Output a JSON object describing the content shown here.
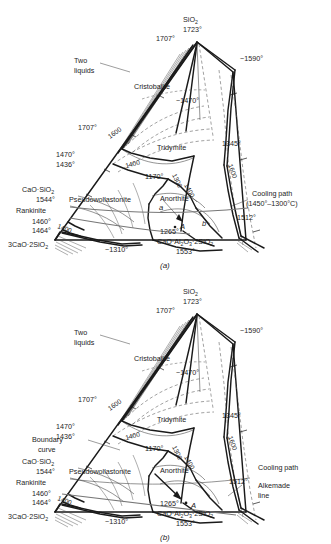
{
  "figure": {
    "type": "ternary-phase-diagram",
    "system": "CaO-Al2O3-SiO2",
    "panels": [
      {
        "caption": "(a)",
        "vertices": {
          "apex": {
            "formula": "SiO2",
            "temp": "1723°"
          },
          "left_side_top": "1707°",
          "right_note": "~1590°"
        },
        "labels": [
          {
            "name": "two-liquids",
            "text": "Two\nliquids",
            "line1": "Two",
            "line2": "liquids"
          },
          {
            "name": "cristobalite",
            "text": "Cristobalite"
          },
          {
            "name": "tridymite",
            "text": "Tridymite"
          },
          {
            "name": "pseudowollastonite",
            "text": "Pseudowollastonite"
          },
          {
            "name": "anorthite",
            "text": "Anorthite"
          },
          {
            "name": "rankinite",
            "text": "Rankinite"
          },
          {
            "name": "cooling-path",
            "line1": "Cooling path",
            "line2": "(1450°–1300°C)"
          }
        ],
        "temperatures": [
          "1723°",
          "1707°",
          "~1590°",
          "~1470°",
          "1707°",
          "1470°",
          "1436°",
          "1170°",
          "1345°",
          "1512°",
          "1544°",
          "1460°",
          "1464°",
          "1265°",
          "~1310°",
          "1553°"
        ],
        "isotherms": [
          "1600",
          "1600",
          "1400",
          "1400",
          "1300",
          "1400",
          "1600"
        ],
        "compounds": [
          {
            "name": "cao-sio2",
            "text": "CaO·SiO2",
            "temp": "1544°"
          },
          {
            "name": "3cao-2sio2",
            "text": "3CaO·2SiO2"
          },
          {
            "name": "cao-al2o3-2sio2",
            "text": "CaO·Al2O3·2SiO2",
            "temp": "1553°"
          }
        ],
        "point_markers": [
          "a",
          "A",
          "b"
        ]
      },
      {
        "caption": "(b)",
        "vertices": {
          "apex": {
            "formula": "SiO2",
            "temp": "1723°"
          },
          "left_side_top": "1707°",
          "right_note": "~1590°"
        },
        "labels": [
          {
            "name": "two-liquids",
            "line1": "Two",
            "line2": "liquids"
          },
          {
            "name": "cristobalite",
            "text": "Cristobalite"
          },
          {
            "name": "tridymite",
            "text": "Tridymite"
          },
          {
            "name": "boundary-curve",
            "line1": "Boundary",
            "line2": "curve"
          },
          {
            "name": "pseudowollastonite",
            "text": "Pseudowollastonite"
          },
          {
            "name": "anorthite",
            "text": "Anorthite"
          },
          {
            "name": "rankinite",
            "text": "Rankinite"
          },
          {
            "name": "cooling-path",
            "text": "Cooling path"
          },
          {
            "name": "alkemade-line",
            "line1": "Alkemade",
            "line2": "line"
          }
        ],
        "temperatures": [
          "1723°",
          "1707°",
          "~1590°",
          "~1470°",
          "1707°",
          "1470°",
          "1436°",
          "1170°",
          "1345°",
          "1512°",
          "1544°",
          "1460°",
          "1464°",
          "1265°",
          "~1310°",
          "1553°"
        ],
        "isotherms": [
          "1600",
          "1600",
          "1400",
          "1400",
          "1300",
          "1400",
          "1600"
        ],
        "compounds": [
          {
            "name": "cao-sio2",
            "text": "CaO·SiO2",
            "temp": "1544°"
          },
          {
            "name": "3cao-2sio2",
            "text": "3CaO·2SiO2"
          },
          {
            "name": "cao-al2o3-2sio2",
            "text": "CaO·Al2O3·2SiO2",
            "temp": "1553°"
          }
        ],
        "point_markers": [
          "A"
        ]
      }
    ]
  },
  "a": {
    "apex_formula": "SiO",
    "apex_sub": "2",
    "apex_temp": "1723°",
    "t_1707_apex": "1707°",
    "t_1590": "~1590°",
    "two_liquids_1": "Two",
    "two_liquids_2": "liquids",
    "cristobalite": "Cristobalite",
    "t_1470_in": "~1470°",
    "t_1707_left": "1707°",
    "iso_1600_left": "1600",
    "t_1470_l": "1470°",
    "t_1436_l": "1436°",
    "tridymite": "Tridymite",
    "iso_1400_mid": "1400",
    "t_1170": "1170°",
    "iso_1300": "1300",
    "iso_1400_r": "1400",
    "t_1345": "1345°",
    "iso_1600_r": "1600",
    "caosio2": "CaO·SiO",
    "caosio2_sub": "2",
    "t_1544": "1544°",
    "rankinite": "Rankinite",
    "t_1460": "1460°",
    "t_1464": "1464°",
    "pseudo": "Pseudowollastonite",
    "anorthite": "Anorthite",
    "cooling_1": "Cooling path",
    "cooling_2": "(1450°–1300°C)",
    "t_1512": "1512°",
    "iso_1400_ll": "1400",
    "t_1265": "1265°",
    "c3ca": "3CaO·2SiO",
    "c3ca_sub": "2",
    "t_1310": "~1310°",
    "anor_formula_1": "CaO·Al",
    "anor_sub1": "2",
    "anor_formula_2": "O",
    "anor_sub2": "3",
    "anor_formula_3": "·2SiO",
    "anor_sub3": "2",
    "t_1553": "1553°",
    "mark_a": "a",
    "mark_A": "A",
    "mark_b": "b",
    "caption": "(a)"
  },
  "b": {
    "apex_formula": "SiO",
    "apex_sub": "2",
    "apex_temp": "1723°",
    "t_1707_apex": "1707°",
    "t_1590": "~1590°",
    "two_liquids_1": "Two",
    "two_liquids_2": "liquids",
    "cristobalite": "Cristobalite",
    "t_1470_in": "~1470°",
    "t_1707_left": "1707°",
    "iso_1600_left": "1600",
    "t_1470_l": "1470°",
    "t_1436_l": "1436°",
    "tridymite": "Tridymite",
    "iso_1400_mid": "1400",
    "t_1170": "1170°",
    "iso_1300": "1300",
    "iso_1400_r": "1400",
    "t_1345": "1345°",
    "iso_1600_r": "1600",
    "boundary_1": "Boundary",
    "boundary_2": "curve",
    "caosio2": "CaO·SiO",
    "caosio2_sub": "2",
    "t_1544": "1544°",
    "rankinite": "Rankinite",
    "t_1460": "1460°",
    "t_1464": "1464°",
    "pseudo": "Pseudowollastonite",
    "anorthite": "Anorthite",
    "cooling": "Cooling path",
    "alkemade_1": "Alkemade",
    "alkemade_2": "line",
    "t_1512": "1512°",
    "iso_1400_ll": "1400",
    "t_1265": "1265°",
    "c3ca": "3CaO·2SiO",
    "c3ca_sub": "2",
    "t_1310": "~1310°",
    "anor_formula_1": "CaO·Al",
    "anor_sub1": "2",
    "anor_formula_2": "O",
    "anor_sub2": "3",
    "anor_formula_3": "·2SiO",
    "anor_sub3": "2",
    "t_1553": "1553°",
    "mark_A": "A",
    "caption": "(b)"
  }
}
